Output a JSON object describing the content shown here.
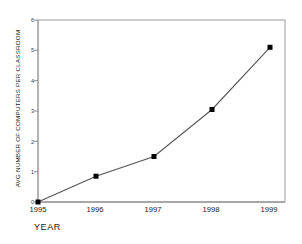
{
  "chart_data": {
    "type": "line",
    "title": "",
    "xlabel": "YEAR",
    "ylabel": "AVG NUMBER OF COMPUTERS PER CLASSROOM",
    "categories": [
      "1995",
      "1996",
      "1997",
      "1998",
      "1999"
    ],
    "x": [
      1995,
      1996,
      1997,
      1998,
      1999
    ],
    "values": [
      0,
      0.85,
      1.5,
      3.05,
      5.1
    ],
    "series": [
      {
        "name": "Avg number of computers per classroom",
        "values": [
          0,
          0.85,
          1.5,
          3.05,
          5.1
        ]
      }
    ],
    "xlim": [
      1995,
      1999
    ],
    "ylim": [
      0,
      6
    ],
    "ytick_labels": [
      "0",
      "1",
      "2",
      "3",
      "4",
      "5",
      "6"
    ],
    "ytick_values": [
      0,
      1,
      2,
      3,
      4,
      5,
      6
    ],
    "xtick_labels": [
      "1995",
      "1996",
      "1997",
      "1998",
      "1999"
    ],
    "grid": false,
    "legend": "none",
    "marker": "square",
    "line_color": "#555555",
    "marker_color": "#000000",
    "axis_color": "#808080",
    "background_color": "#ffffff"
  }
}
